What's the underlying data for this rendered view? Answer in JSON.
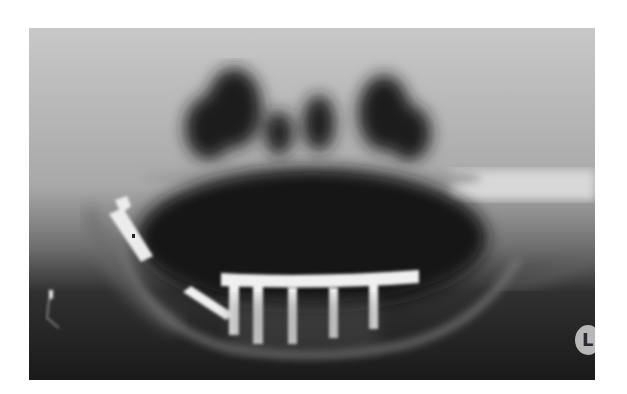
{
  "image": {
    "subject": "panoramic dental radiograph",
    "side_marker": "L",
    "colors": {
      "background": "#ffffff",
      "film_dark": "#1a1a1a",
      "bone": "#9a9a9a",
      "metal": "#f0f0f0"
    }
  }
}
